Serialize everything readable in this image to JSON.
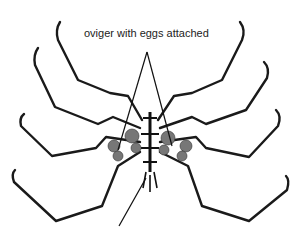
{
  "figure": {
    "label": "oviger with eggs attached",
    "colors": {
      "ink": "#1a1a1a",
      "background": "#ffffff"
    }
  }
}
